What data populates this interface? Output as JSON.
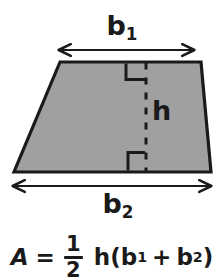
{
  "figure": {
    "shape": {
      "name": "trapezoid",
      "fill_color": "#a0a0a0",
      "stroke_color": "#1a1a1a",
      "vertices": [
        [
          60,
          62
        ],
        [
          201,
          62
        ],
        [
          211,
          172
        ],
        [
          14,
          172
        ]
      ]
    },
    "labels": {
      "top_base": "b",
      "top_base_sub": "1",
      "bottom_base": "b",
      "bottom_base_sub": "2",
      "height": "h"
    },
    "dimension_arrows": {
      "top": {
        "name": "b1-arrow",
        "y": 50,
        "x_start": 58,
        "x_end": 195
      },
      "bottom": {
        "name": "b2-arrow",
        "y": 186,
        "x_start": 12,
        "x_end": 212
      }
    },
    "height_line": {
      "name": "height-dashed-line",
      "x": 146,
      "y_start": 62,
      "y_end": 172,
      "style": "dashed"
    },
    "right_angle_marks": 2
  },
  "formula": {
    "area_symbol": "A",
    "equals": "=",
    "fraction_numerator": "1",
    "fraction_denominator": "2",
    "height_var": "h",
    "open_paren": "(",
    "base1": "b",
    "base1_sub": "1",
    "plus": "+",
    "base2": "b",
    "base2_sub": "2",
    "close_paren": ")",
    "full_text": "A = 1/2 h(b1 + b2)"
  },
  "colors": {
    "background": "#ffffff",
    "ink": "#1a1a1a",
    "shape_fill": "#a0a0a0"
  }
}
